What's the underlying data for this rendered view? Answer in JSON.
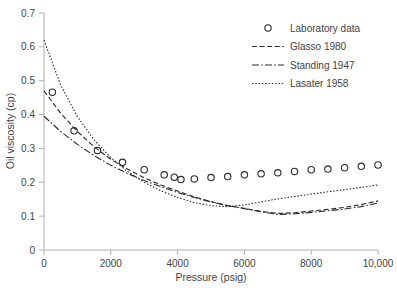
{
  "chart_data": {
    "type": "scatter",
    "title": "",
    "xlabel": "Pressure (psig)",
    "ylabel": "Oil viscosity (cp)",
    "xlim": [
      0,
      10000
    ],
    "ylim": [
      0,
      0.7
    ],
    "grid": false,
    "legend_position": "top-right",
    "xticks": [
      0,
      2000,
      4000,
      6000,
      8000,
      10000
    ],
    "xticklabels": [
      "0",
      "2000",
      "4000",
      "6000",
      "8000",
      "10,000"
    ],
    "yticks": [
      0,
      0.1,
      0.2,
      0.3,
      0.4,
      0.5,
      0.6,
      0.7
    ],
    "yticklabels": [
      "0",
      "0.1",
      "0.2",
      "0.3",
      "0.4",
      "0.5",
      "0.6",
      "0.7"
    ],
    "series": [
      {
        "name": "Laboratory data",
        "style": "markers",
        "marker": "open-circle",
        "x": [
          250,
          900,
          1600,
          2350,
          3000,
          3600,
          3900,
          4100,
          4500,
          5000,
          5500,
          6000,
          6500,
          7000,
          7500,
          8000,
          8500,
          9000,
          9500,
          10000
        ],
        "y": [
          0.466,
          0.352,
          0.294,
          0.259,
          0.237,
          0.222,
          0.215,
          0.208,
          0.21,
          0.214,
          0.217,
          0.222,
          0.225,
          0.228,
          0.232,
          0.237,
          0.239,
          0.243,
          0.247,
          0.251
        ]
      },
      {
        "name": "Glasso 1980",
        "style": "dashed",
        "x": [
          0,
          500,
          1000,
          1500,
          2000,
          2500,
          3000,
          3500,
          4000,
          4500,
          5000,
          5500,
          6000,
          6500,
          7000,
          7500,
          8000,
          8500,
          9000,
          9500,
          10000
        ],
        "y": [
          0.47,
          0.404,
          0.35,
          0.305,
          0.268,
          0.239,
          0.213,
          0.192,
          0.174,
          0.157,
          0.143,
          0.131,
          0.123,
          0.114,
          0.108,
          0.11,
          0.115,
          0.12,
          0.126,
          0.134,
          0.145
        ]
      },
      {
        "name": "Standing 1947",
        "style": "dash-dot",
        "x": [
          0,
          500,
          1000,
          1500,
          2000,
          2500,
          3000,
          3500,
          4000,
          4500,
          5000,
          5500,
          6000,
          6500,
          7000,
          7500,
          8000,
          8500,
          9000,
          9500,
          10000
        ],
        "y": [
          0.395,
          0.35,
          0.312,
          0.279,
          0.25,
          0.226,
          0.205,
          0.187,
          0.17,
          0.155,
          0.142,
          0.131,
          0.122,
          0.113,
          0.105,
          0.107,
          0.111,
          0.116,
          0.121,
          0.128,
          0.139
        ]
      },
      {
        "name": "Lasater 1958",
        "style": "dotted",
        "x": [
          0,
          500,
          1000,
          1500,
          2000,
          2500,
          3000,
          3500,
          4000,
          4500,
          5000,
          5500,
          6000,
          6500,
          7000,
          7500,
          8000,
          8500,
          9000,
          9500,
          10000
        ],
        "y": [
          0.62,
          0.487,
          0.394,
          0.325,
          0.273,
          0.232,
          0.2,
          0.175,
          0.155,
          0.14,
          0.131,
          0.128,
          0.133,
          0.142,
          0.151,
          0.158,
          0.165,
          0.172,
          0.178,
          0.185,
          0.192
        ]
      }
    ],
    "legend": [
      {
        "label": "Laboratory data",
        "style": "markers"
      },
      {
        "label": "Glasso 1980",
        "style": "dashed"
      },
      {
        "label": "Standing 1947",
        "style": "dash-dot"
      },
      {
        "label": "Lasater 1958",
        "style": "dotted"
      }
    ],
    "colors": {
      "line": "#2b2b2b",
      "axis": "#b0b0b0",
      "text": "#3f3f3f",
      "background": "#ffffff"
    }
  }
}
